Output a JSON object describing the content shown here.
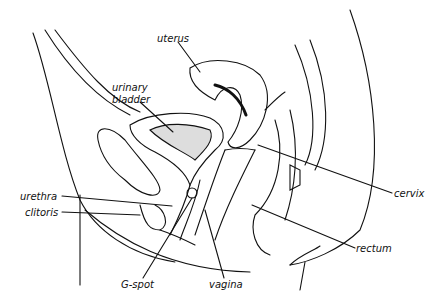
{
  "diagram": {
    "type": "anatomical-cross-section",
    "colors": {
      "ink": "#111111",
      "background": "#ffffff"
    },
    "labels": {
      "uterus": "uterus",
      "urinary_bladder_line1": "urinary",
      "urinary_bladder_line2": "bladder",
      "urethra": "urethra",
      "clitoris": "clitoris",
      "cervix": "cervix",
      "rectum": "rectum",
      "g_spot": "G-spot",
      "vagina": "vagina"
    }
  }
}
